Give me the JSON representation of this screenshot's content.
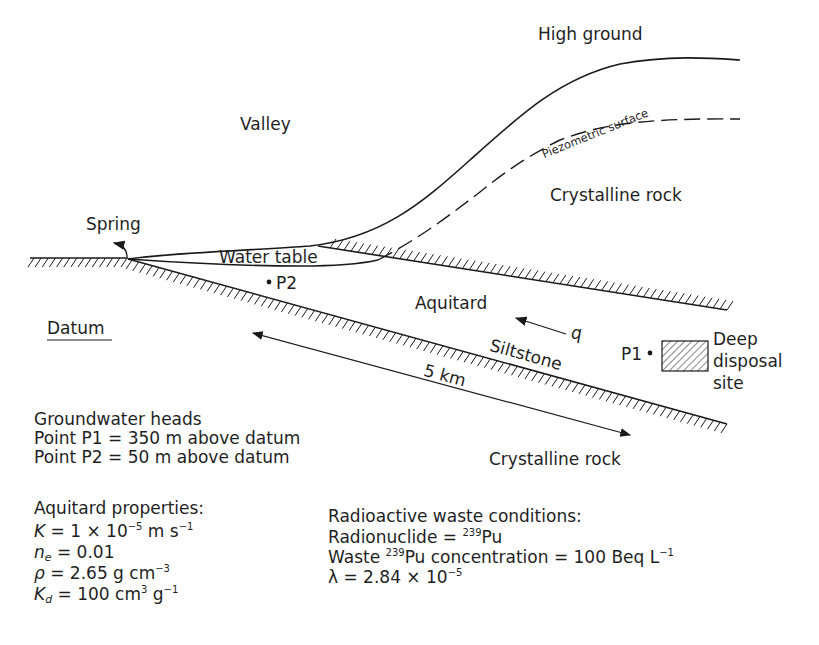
{
  "labels": {
    "high_ground": "High ground",
    "valley": "Valley",
    "piezometric_surface": "Piezometric  surface",
    "crystalline_rock_upper": "Crystalline rock",
    "spring": "Spring",
    "water_table": "Water table",
    "p2": "P2",
    "aquitard": "Aquitard",
    "q": "q",
    "datum": "Datum",
    "siltstone": "Siltstone",
    "p1": "P1",
    "deep_disposal_site": [
      "Deep",
      "disposal",
      "site"
    ],
    "distance": "5 km",
    "crystalline_rock_lower": "Crystalline rock"
  },
  "groundwater_heads": {
    "title": "Groundwater heads",
    "lines": [
      "Point P1 = 350 m above datum",
      "Point P2 = 50 m above datum"
    ]
  },
  "aquitard_properties": {
    "title": "Aquitard properties:",
    "K": {
      "symbol": "K",
      "eq": " = 1 × 10",
      "exp": "−5",
      "unit": " m s",
      "unit_exp": "−1"
    },
    "ne": {
      "symbol": "n",
      "sub": "e",
      "eq": " = 0.01"
    },
    "rho": {
      "symbol": "ρ",
      "eq": " = 2.65 g cm",
      "exp": "−3"
    },
    "Kd": {
      "symbol": "K",
      "sub": "d",
      "eq": " = 100 cm",
      "exp": "3",
      "unit": " g",
      "unit_exp": "−1"
    }
  },
  "waste_conditions": {
    "title": "Radioactive waste conditions:",
    "radionuclide": {
      "prefix": "Radionuclide = ",
      "mass": "239",
      "element": "Pu"
    },
    "concentration": {
      "prefix": "Waste ",
      "mass": "239",
      "element": "Pu",
      "text": " concentration = 100 Beq L",
      "exp": "−1"
    },
    "lambda": {
      "symbol": "λ",
      "eq": " = 2.84 × 10",
      "exp": "−5"
    }
  },
  "colors": {
    "ink": "#1a1a1a",
    "background": "#ffffff"
  }
}
